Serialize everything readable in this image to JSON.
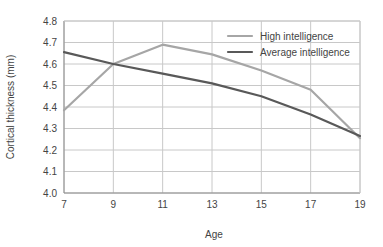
{
  "chart_data": {
    "type": "line",
    "title": "",
    "xlabel": "Age",
    "ylabel": "Cortical thickness (mm)",
    "x": [
      7,
      9,
      11,
      13,
      15,
      17,
      19
    ],
    "xtick_labels": [
      "7",
      "9",
      "11",
      "13",
      "15",
      "17",
      "19"
    ],
    "ytick_labels": [
      "4.0",
      "4.1",
      "4.2",
      "4.3",
      "4.4",
      "4.5",
      "4.6",
      "4.7",
      "4.8"
    ],
    "yticks": [
      4.0,
      4.1,
      4.2,
      4.3,
      4.4,
      4.5,
      4.6,
      4.7,
      4.8
    ],
    "xlim": [
      7,
      19
    ],
    "ylim": [
      4.0,
      4.8
    ],
    "grid": true,
    "legend_position": "top-right",
    "series": [
      {
        "name": "High intelligence",
        "color": "#a6a6a6",
        "values": [
          4.385,
          4.6,
          4.69,
          4.645,
          4.57,
          4.48,
          4.255
        ]
      },
      {
        "name": "Average intelligence",
        "color": "#595959",
        "values": [
          4.655,
          4.6,
          4.555,
          4.51,
          4.45,
          4.365,
          4.265
        ]
      }
    ]
  },
  "style": {
    "grid_color": "#c8c8c8",
    "axis_color": "#8c8c8c",
    "text_color": "#444444",
    "background": "#ffffff"
  }
}
